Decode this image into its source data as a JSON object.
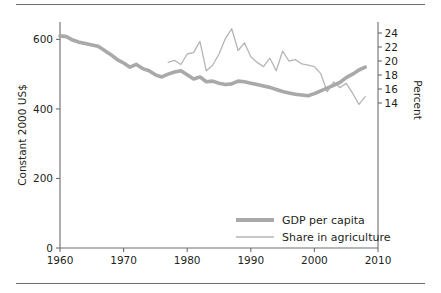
{
  "figure": {
    "has_top_rule": true,
    "has_bottom_rule": true,
    "background": "#ffffff",
    "line_color_gdp": "#a9a9a9",
    "line_color_agriculture": "#b5b5b5",
    "axis_color": "#6d6e71",
    "text_color": "#231f20"
  },
  "chart_data": {
    "type": "line",
    "title": "",
    "xlabel": "",
    "ylabel": "Constant 2000 US$",
    "y2label": "Percent",
    "xlim": [
      1960,
      2010
    ],
    "ylim": [
      0,
      650
    ],
    "y2lim": [
      13,
      25
    ],
    "xticks": [
      1960,
      1970,
      1980,
      1990,
      2000,
      2010
    ],
    "yticks": [
      0,
      200,
      400,
      600
    ],
    "y2ticks": [
      14,
      16,
      18,
      20,
      22,
      24
    ],
    "grid": false,
    "legend_position": "lower right",
    "series": [
      {
        "name": "GDP per capita",
        "axis": "left",
        "units": "Constant 2000 US$",
        "x": [
          1960,
          1961,
          1962,
          1963,
          1964,
          1965,
          1966,
          1967,
          1968,
          1969,
          1970,
          1971,
          1972,
          1973,
          1974,
          1975,
          1976,
          1977,
          1978,
          1979,
          1980,
          1981,
          1982,
          1983,
          1984,
          1985,
          1986,
          1987,
          1988,
          1989,
          1990,
          1991,
          1992,
          1993,
          1994,
          1995,
          1996,
          1997,
          1998,
          1999,
          2000,
          2001,
          2002,
          2003,
          2004,
          2005,
          2006,
          2007,
          2008
        ],
        "values": [
          610,
          608,
          598,
          592,
          588,
          584,
          580,
          568,
          556,
          542,
          532,
          520,
          528,
          516,
          510,
          498,
          492,
          500,
          506,
          510,
          498,
          486,
          492,
          478,
          480,
          474,
          470,
          472,
          480,
          478,
          474,
          470,
          466,
          462,
          456,
          450,
          446,
          442,
          440,
          438,
          444,
          452,
          460,
          468,
          476,
          490,
          500,
          512,
          520
        ]
      },
      {
        "name": "Share in agriculture",
        "axis": "right",
        "units": "Percent",
        "x": [
          1977,
          1978,
          1979,
          1980,
          1981,
          1982,
          1983,
          1984,
          1985,
          1986,
          1987,
          1988,
          1989,
          1990,
          1991,
          1992,
          1993,
          1994,
          1995,
          1996,
          1997,
          1998,
          1999,
          2000,
          2001,
          2002,
          2003,
          2004,
          2005,
          2006,
          2007,
          2008
        ],
        "values": [
          19.8,
          20.1,
          19.5,
          21.0,
          21.2,
          22.8,
          18.6,
          19.4,
          21.0,
          23.2,
          24.6,
          21.5,
          22.6,
          20.6,
          19.8,
          19.2,
          20.4,
          18.6,
          21.4,
          20.0,
          20.2,
          19.6,
          19.4,
          19.2,
          18.2,
          15.6,
          17.0,
          16.2,
          16.8,
          15.4,
          13.8,
          14.9
        ]
      }
    ]
  },
  "axes": {
    "left_title": "Constant 2000 US$",
    "right_title": "Percent",
    "left_tick_labels": [
      "600",
      "400",
      "200",
      "0"
    ],
    "right_tick_labels": [
      "24",
      "22",
      "20",
      "18",
      "16",
      "14"
    ],
    "bottom_tick_labels": [
      "1960",
      "1970",
      "1980",
      "1990",
      "2000",
      "2010"
    ]
  },
  "legend": {
    "items": [
      {
        "label": "GDP per capita",
        "style": "thick-line"
      },
      {
        "label": "Share in agriculture",
        "style": "thin-line"
      }
    ]
  }
}
